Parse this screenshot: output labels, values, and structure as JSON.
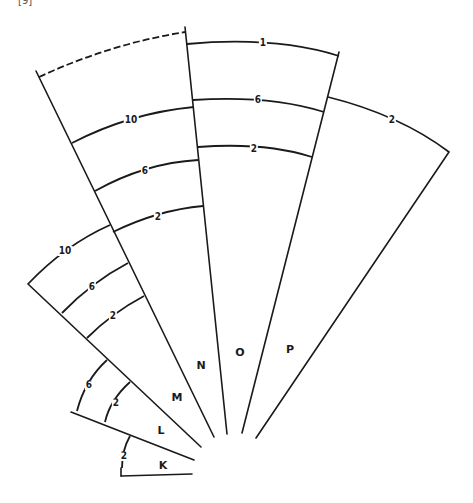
{
  "corner_mark": "[9]",
  "sectors": [
    {
      "name": "K",
      "label_pos": [
        163,
        465
      ],
      "contours": [
        {
          "value": "2",
          "pos": [
            124,
            456
          ]
        }
      ]
    },
    {
      "name": "L",
      "label_pos": [
        161,
        430
      ],
      "contours": [
        {
          "value": "2",
          "pos": [
            116,
            403
          ]
        },
        {
          "value": "6",
          "pos": [
            89,
            385
          ]
        }
      ]
    },
    {
      "name": "M",
      "label_pos": [
        177,
        397
      ],
      "contours": [
        {
          "value": "2",
          "pos": [
            113,
            316
          ]
        },
        {
          "value": "6",
          "pos": [
            92,
            287
          ]
        },
        {
          "value": "10",
          "pos": [
            65,
            251
          ]
        }
      ]
    },
    {
      "name": "N",
      "label_pos": [
        201,
        365
      ],
      "contours": [
        {
          "value": "2",
          "pos": [
            158,
            217
          ]
        },
        {
          "value": "6",
          "pos": [
            145,
            171
          ]
        },
        {
          "value": "10",
          "pos": [
            131,
            120
          ]
        }
      ]
    },
    {
      "name": "O",
      "label_pos": [
        240,
        352
      ],
      "contours": [
        {
          "value": "2",
          "pos": [
            254,
            149
          ]
        },
        {
          "value": "6",
          "pos": [
            258,
            100
          ]
        },
        {
          "value": "1",
          "pos": [
            263,
            43
          ]
        }
      ]
    },
    {
      "name": "P",
      "label_pos": [
        290,
        349
      ],
      "contours": [
        {
          "value": "2",
          "pos": [
            392,
            120
          ]
        }
      ]
    }
  ],
  "colors": {
    "ink": "#1a1a1a",
    "background": "#ffffff"
  }
}
